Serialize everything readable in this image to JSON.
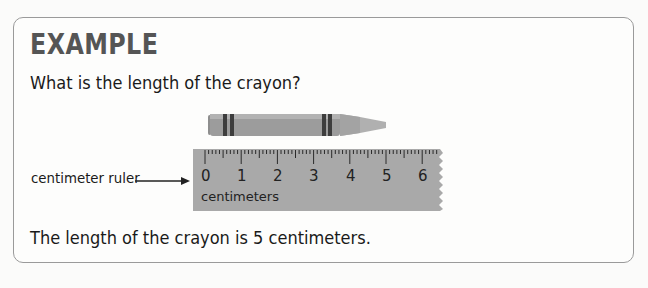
{
  "example": {
    "heading": "EXAMPLE",
    "question": "What is the length of the crayon?",
    "ruler_label": "centimeter ruler",
    "ruler_unit": "centimeters",
    "ruler_numbers": [
      "0",
      "1",
      "2",
      "3",
      "4",
      "5",
      "6"
    ],
    "answer": "The length of the crayon is 5 centimeters."
  },
  "colors": {
    "crayon": "#9a9a9a",
    "crayon_stripe": "#3d3d3d",
    "ruler": "#a9a9a9",
    "heading": "#555555",
    "border": "#9a9a9a"
  },
  "icons": {
    "arrow": "right-arrow-icon"
  }
}
